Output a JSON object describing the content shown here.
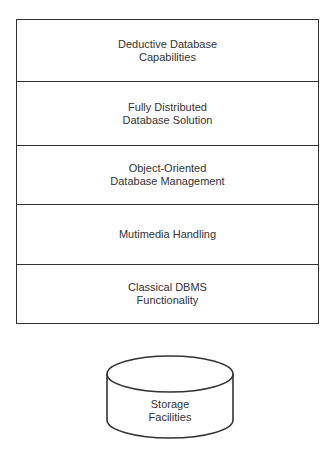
{
  "diagram": {
    "layers": [
      {
        "label": "Deductive Database\nCapabilities"
      },
      {
        "label": "Fully Distributed\nDatabase Solution"
      },
      {
        "label": "Object-Oriented\nDatabase Management"
      },
      {
        "label": "Mutimedia Handling"
      },
      {
        "label": "Classical DBMS\nFunctionality"
      }
    ],
    "storage": {
      "label": "Storage\nFacilities",
      "shape": "cylinder-icon"
    },
    "colors": {
      "line": "#333333",
      "background": "#ffffff"
    }
  }
}
